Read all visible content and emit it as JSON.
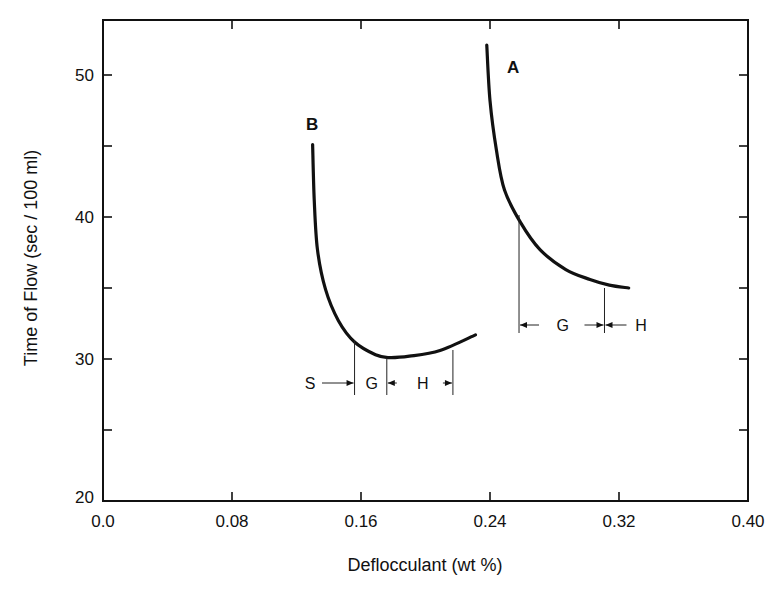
{
  "chart_data": {
    "type": "line",
    "title": "",
    "xlabel": "Deflocculant (wt %)",
    "ylabel": "Time of Flow (sec / 100 ml)",
    "xlim": [
      0.0,
      0.4
    ],
    "ylim": [
      20,
      54
    ],
    "xticks": [
      0.0,
      0.08,
      0.16,
      0.24,
      0.32,
      0.4
    ],
    "xtick_labels": [
      "0.0",
      "0.08",
      "0.16",
      "0.24",
      "0.32",
      "0.40"
    ],
    "yticks": [
      20,
      25,
      30,
      35,
      40,
      45,
      50
    ],
    "ytick_labels": [
      "20",
      "",
      "30",
      "",
      "40",
      "",
      "50"
    ],
    "grid": false,
    "legend": "none (curves labeled directly)",
    "series": [
      {
        "name": "B",
        "x": [
          0.13,
          0.131,
          0.133,
          0.138,
          0.146,
          0.156,
          0.169,
          0.177,
          0.19,
          0.209,
          0.231
        ],
        "y": [
          45.1,
          41.2,
          37.7,
          34.9,
          32.7,
          31.2,
          30.3,
          30.1,
          30.2,
          30.6,
          31.7
        ]
      },
      {
        "name": "A",
        "x": [
          0.238,
          0.24,
          0.244,
          0.249,
          0.259,
          0.271,
          0.287,
          0.302,
          0.314,
          0.326
        ],
        "y": [
          52.1,
          48.2,
          44.7,
          41.9,
          39.6,
          37.7,
          36.3,
          35.6,
          35.2,
          35.0
        ]
      }
    ],
    "annotations": {
      "B": {
        "boundaries_x": [
          0.156,
          0.176,
          0.217
        ],
        "regions": [
          "S",
          "G",
          "H"
        ]
      },
      "A": {
        "boundaries_x": [
          0.258,
          0.311
        ],
        "regions": [
          "G",
          "H"
        ]
      }
    }
  }
}
